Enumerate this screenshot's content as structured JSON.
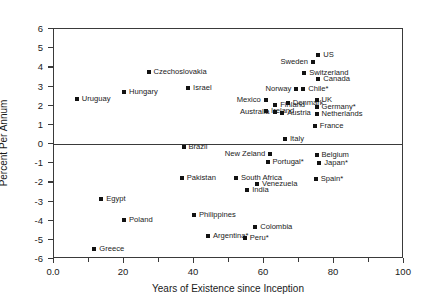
{
  "chart_data": {
    "type": "scatter",
    "title": "",
    "xlabel": "Years of Existence since Inception",
    "ylabel": "Percent Per Annum",
    "xlim": [
      0,
      100
    ],
    "ylim": [
      -6,
      6
    ],
    "xticks": [
      "0.0",
      "20",
      "40",
      "60",
      "80",
      "100"
    ],
    "xtick_values": [
      0,
      20,
      40,
      60,
      80,
      100
    ],
    "xminor_values": [
      10,
      30,
      50,
      70,
      90
    ],
    "yticks": [
      "6",
      "5",
      "4",
      "3",
      "2",
      "1",
      "0",
      "-1",
      "-2",
      "-3",
      "-4",
      "-5",
      "-6"
    ],
    "ytick_values": [
      6,
      5,
      4,
      3,
      2,
      1,
      0,
      -1,
      -2,
      -3,
      -4,
      -5,
      -6
    ],
    "grid": false,
    "legend": "none",
    "zero_line": 0,
    "points": [
      {
        "label": "Uruguay",
        "x": 6.5,
        "y": 2.35,
        "side": "right"
      },
      {
        "label": "Hungary",
        "x": 20.0,
        "y": 2.72,
        "side": "right"
      },
      {
        "label": "Czechoslovakia",
        "x": 27.0,
        "y": 3.75,
        "side": "right"
      },
      {
        "label": "Israel",
        "x": 38.3,
        "y": 2.92,
        "side": "right"
      },
      {
        "label": "US",
        "x": 75.5,
        "y": 4.62,
        "side": "right"
      },
      {
        "label": "Sweden",
        "x": 74.0,
        "y": 4.28,
        "side": "left"
      },
      {
        "label": "Switzerland",
        "x": 71.5,
        "y": 3.7,
        "side": "right"
      },
      {
        "label": "Canada",
        "x": 75.5,
        "y": 3.38,
        "side": "right"
      },
      {
        "label": "Norway",
        "x": 69.2,
        "y": 2.85,
        "side": "left"
      },
      {
        "label": "Chile*",
        "x": 71.2,
        "y": 2.86,
        "side": "right"
      },
      {
        "label": "Mexico",
        "x": 60.5,
        "y": 2.28,
        "side": "left"
      },
      {
        "label": "UK",
        "x": 75.0,
        "y": 2.32,
        "side": "right"
      },
      {
        "label": "Denmark",
        "x": 66.8,
        "y": 2.12,
        "side": "right"
      },
      {
        "label": "Finland",
        "x": 63.2,
        "y": 2.05,
        "side": "right"
      },
      {
        "label": "Germany*",
        "x": 75.0,
        "y": 1.92,
        "side": "right"
      },
      {
        "label": "Ireland",
        "x": 60.6,
        "y": 1.7,
        "side": "right"
      },
      {
        "label": "Austria",
        "x": 65.2,
        "y": 1.62,
        "side": "right"
      },
      {
        "label": "Netherlands",
        "x": 75.0,
        "y": 1.58,
        "side": "right"
      },
      {
        "label": "Australia",
        "x": 63.0,
        "y": 1.65,
        "side": "left"
      },
      {
        "label": "France",
        "x": 74.5,
        "y": 0.95,
        "side": "right"
      },
      {
        "label": "Italy",
        "x": 66.0,
        "y": 0.27,
        "side": "right"
      },
      {
        "label": "Brazil",
        "x": 37.0,
        "y": -0.18,
        "side": "right"
      },
      {
        "label": "New Zeland",
        "x": 61.8,
        "y": -0.52,
        "side": "left"
      },
      {
        "label": "Belgium",
        "x": 75.0,
        "y": -0.55,
        "side": "right"
      },
      {
        "label": "Portugal*",
        "x": 61.0,
        "y": -0.92,
        "side": "right"
      },
      {
        "label": "Japan*",
        "x": 75.8,
        "y": -1.0,
        "side": "right"
      },
      {
        "label": "Pakistan",
        "x": 36.5,
        "y": -1.78,
        "side": "right"
      },
      {
        "label": "South Africa",
        "x": 52.0,
        "y": -1.78,
        "side": "right"
      },
      {
        "label": "Spain*",
        "x": 74.8,
        "y": -1.85,
        "side": "right"
      },
      {
        "label": "Venezuela",
        "x": 58.0,
        "y": -2.1,
        "side": "right"
      },
      {
        "label": "India",
        "x": 55.2,
        "y": -2.42,
        "side": "right"
      },
      {
        "label": "Egypt",
        "x": 13.5,
        "y": -2.85,
        "side": "right"
      },
      {
        "label": "Philippines",
        "x": 40.0,
        "y": -3.72,
        "side": "right"
      },
      {
        "label": "Poland",
        "x": 20.0,
        "y": -3.95,
        "side": "right"
      },
      {
        "label": "Colombia",
        "x": 57.5,
        "y": -4.32,
        "side": "right"
      },
      {
        "label": "Argentina*",
        "x": 44.0,
        "y": -4.8,
        "side": "right"
      },
      {
        "label": "Peru*",
        "x": 54.5,
        "y": -4.92,
        "side": "right"
      },
      {
        "label": "Greece",
        "x": 11.5,
        "y": -5.48,
        "side": "right"
      }
    ]
  }
}
